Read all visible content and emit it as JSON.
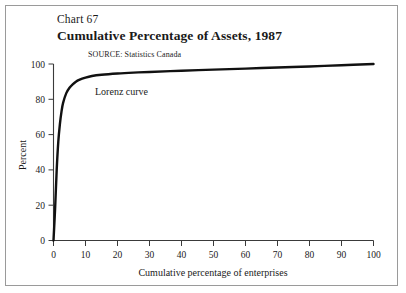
{
  "figure": {
    "chart_number": "Chart 67",
    "title": "Cumulative Percentage of Assets, 1987",
    "source": "SOURCE:  Statistics Canada",
    "border_color": "#9a9a9a",
    "background": "#ffffff"
  },
  "chart_data": {
    "type": "line",
    "title": "Cumulative Percentage of Assets, 1987",
    "subtitle": "Chart 67",
    "source": "SOURCE:  Statistics Canada",
    "xlabel": "Cumulative percentage of enterprises",
    "ylabel": "Percent",
    "xlim": [
      0,
      100
    ],
    "ylim": [
      0,
      100
    ],
    "grid": false,
    "legend": "none",
    "line_color": "#111111",
    "annotations": [
      {
        "text": "Lorenz curve",
        "x": 13,
        "y": 82
      }
    ],
    "xticks": [
      0,
      10,
      20,
      30,
      40,
      50,
      60,
      70,
      80,
      90,
      100
    ],
    "xtick_labels": [
      "0",
      "10",
      "20",
      "30",
      "40",
      "50",
      "60",
      "70",
      "80",
      "90",
      "100"
    ],
    "yticks": [
      0,
      20,
      40,
      60,
      80,
      100
    ],
    "ytick_labels": [
      "0",
      "20",
      "40",
      "60",
      "80",
      "100"
    ],
    "series": [
      {
        "name": "Lorenz curve",
        "x": [
          0.0,
          0.5,
          1.0,
          1.5,
          2.0,
          2.5,
          3.0,
          4.0,
          5.0,
          6.0,
          7.0,
          8.0,
          10.0,
          12.0,
          15.0,
          20.0,
          25.0,
          30.0,
          40.0,
          50.0,
          60.0,
          70.0,
          80.0,
          90.0,
          100.0
        ],
        "y": [
          0.0,
          18.0,
          40.0,
          56.0,
          66.0,
          73.0,
          78.0,
          83.5,
          86.5,
          88.5,
          90.0,
          91.0,
          92.3,
          93.2,
          93.9,
          94.6,
          95.1,
          95.5,
          96.2,
          96.8,
          97.4,
          98.0,
          98.6,
          99.3,
          100.0
        ]
      }
    ]
  }
}
